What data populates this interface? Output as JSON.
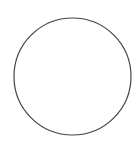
{
  "diagram": {
    "shapes": [
      {
        "type": "circle",
        "cx": 72.5,
        "cy": 76.5,
        "r": 58.5,
        "stroke": "#444444",
        "stroke_width": 1.2,
        "fill": "#ffffff"
      }
    ]
  },
  "colors": {
    "background": "#ffffff",
    "stroke": "#444444"
  }
}
